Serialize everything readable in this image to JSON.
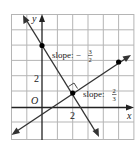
{
  "figure": {
    "type": "coordinate-plane",
    "axes": {
      "x_label": "x",
      "y_label": "y",
      "origin_label": "O"
    },
    "tick_labels": {
      "x": "2",
      "y": "2"
    },
    "grid": {
      "x_range": [
        -2,
        6
      ],
      "y_range": [
        -2,
        6
      ],
      "step": 1
    },
    "lines": [
      {
        "name": "steep-line",
        "slope_label_prefix": "slope: −",
        "slope_num": "3",
        "slope_den": "2",
        "slope": -1.5,
        "point": [
          0,
          4
        ]
      },
      {
        "name": "shallow-line",
        "slope_label_prefix": "slope: ",
        "slope_num": "2",
        "slope_den": "3",
        "slope": 0.6667,
        "point": [
          5,
          3
        ]
      }
    ],
    "intersection": [
      2,
      1
    ],
    "right_angle_marker": true,
    "colors": {
      "grid": "#b5b5b5",
      "axes": "#222222",
      "lines": "#333333",
      "points": "#000000"
    }
  }
}
